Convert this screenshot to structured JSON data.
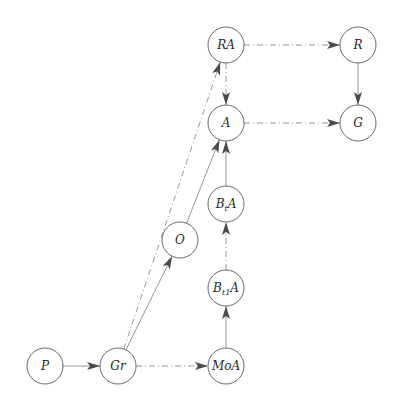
{
  "diagram": {
    "type": "directed-graph",
    "nodes": [
      {
        "id": "RA",
        "label": "RA",
        "x": 226,
        "y": 45
      },
      {
        "id": "R",
        "label": "R",
        "x": 358,
        "y": 45
      },
      {
        "id": "A",
        "label": "A",
        "x": 226,
        "y": 123
      },
      {
        "id": "G",
        "label": "G",
        "x": 358,
        "y": 123
      },
      {
        "id": "BtA",
        "label_main": "B",
        "label_sub": "t",
        "label_tail": "A",
        "x": 226,
        "y": 204
      },
      {
        "id": "O",
        "label": "O",
        "x": 180,
        "y": 240
      },
      {
        "id": "Bt1A",
        "label_main": "B",
        "label_sub": "t1",
        "label_tail": "A",
        "x": 226,
        "y": 288
      },
      {
        "id": "P",
        "label": "P",
        "x": 45,
        "y": 366
      },
      {
        "id": "Gr",
        "label": "Gr",
        "x": 118,
        "y": 366
      },
      {
        "id": "MoA",
        "label": "MoA",
        "x": 226,
        "y": 366
      }
    ],
    "edges": [
      {
        "from": "P",
        "to": "Gr",
        "style": "solid"
      },
      {
        "from": "Gr",
        "to": "MoA",
        "style": "dashed"
      },
      {
        "from": "Gr",
        "to": "O",
        "style": "solid"
      },
      {
        "from": "Gr",
        "to": "RA",
        "style": "dashed"
      },
      {
        "from": "O",
        "to": "A",
        "style": "solid"
      },
      {
        "from": "MoA",
        "to": "Bt1A",
        "style": "solid"
      },
      {
        "from": "Bt1A",
        "to": "BtA",
        "style": "dashed"
      },
      {
        "from": "BtA",
        "to": "A",
        "style": "solid"
      },
      {
        "from": "RA",
        "to": "A",
        "style": "dashed"
      },
      {
        "from": "RA",
        "to": "R",
        "style": "dashed"
      },
      {
        "from": "A",
        "to": "G",
        "style": "dashed"
      },
      {
        "from": "R",
        "to": "G",
        "style": "solid"
      }
    ]
  }
}
